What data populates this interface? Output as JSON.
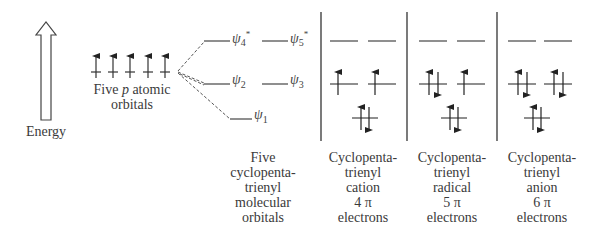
{
  "energy_label": "Energy",
  "atomic_orbitals": {
    "label_line1_pre": "Five ",
    "label_line1_italic": "p",
    "label_line1_post": " atomic",
    "label_line2": "orbitals",
    "count": 5
  },
  "molecular_orbitals": {
    "psi1": {
      "symbol": "ψ",
      "sub": "1",
      "sup": ""
    },
    "psi2": {
      "symbol": "ψ",
      "sub": "2",
      "sup": ""
    },
    "psi3": {
      "symbol": "ψ",
      "sub": "3",
      "sup": ""
    },
    "psi4": {
      "symbol": "ψ",
      "sub": "4",
      "sup": "*"
    },
    "psi5": {
      "symbol": "ψ",
      "sub": "5",
      "sup": "*"
    }
  },
  "columns": [
    {
      "lines": [
        "Five",
        "cyclopenta-",
        "trienyl",
        "molecular",
        "orbitals"
      ]
    },
    {
      "lines": [
        "Cyclopenta-",
        "trienyl",
        "cation",
        "4 π",
        "electrons"
      ],
      "electrons": 4
    },
    {
      "lines": [
        "Cyclopenta-",
        "trienyl",
        "radical",
        "5 π",
        "electrons"
      ],
      "electrons": 5
    },
    {
      "lines": [
        "Cyclopenta-",
        "trienyl",
        "anion",
        "6 π",
        "electrons"
      ],
      "electrons": 6
    }
  ]
}
